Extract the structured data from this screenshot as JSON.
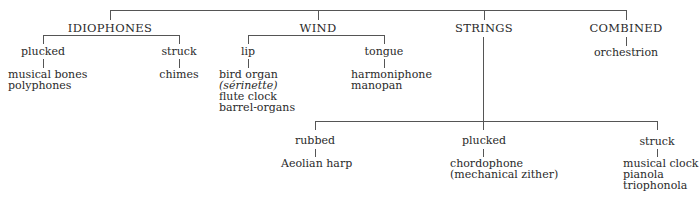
{
  "categories": [
    {
      "name": "IDIOPHONES",
      "branches": [
        {
          "name": "plucked",
          "items": [
            "musical bones",
            "polyphones"
          ]
        },
        {
          "name": "struck",
          "items": [
            "chimes"
          ]
        }
      ]
    },
    {
      "name": "WIND",
      "branches": [
        {
          "name": "lip",
          "items": [
            "bird organ",
            "(sérinette)",
            "flute clock",
            "barrel-organs"
          ]
        },
        {
          "name": "tongue",
          "items": [
            "harmoniphone",
            "manopan"
          ]
        }
      ]
    },
    {
      "name": "STRINGS",
      "branches": [
        {
          "name": "rubbed",
          "items": [
            "Aeolian harp"
          ]
        },
        {
          "name": "plucked",
          "items": [
            "chordophone",
            "(mechanical zither)"
          ]
        },
        {
          "name": "struck",
          "items": [
            "musical clock",
            "pianola",
            "triophonola"
          ]
        }
      ]
    },
    {
      "name": "COMBINED",
      "branches": [],
      "items": [
        "orchestrion"
      ]
    }
  ],
  "colors": {
    "line": "#555555",
    "text": "#2a2a2a",
    "background": "#ffffff"
  }
}
